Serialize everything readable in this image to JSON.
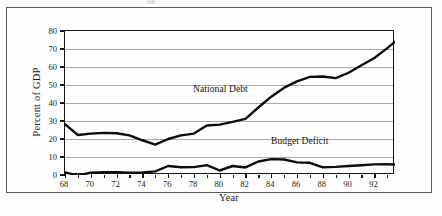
{
  "figure": {
    "frame_border_color": "#5b5b5b",
    "background_color": "#fefefe"
  },
  "axis_titles": {
    "x": "Year",
    "y": "Percent of GDP"
  },
  "annotations": {
    "national_debt": "National Debt",
    "budget_deficit": "Budget Deficit"
  },
  "chart_data": {
    "type": "line",
    "title": "",
    "subtitle": "",
    "xlabel": "Year",
    "ylabel": "Percent of GDP",
    "xlim": [
      68,
      93.6
    ],
    "ylim": [
      0,
      80
    ],
    "grid": true,
    "legend_position": "inline-annotation",
    "line_color": "#0d0d0d",
    "gridline_color": "#a9a9a9",
    "axis_color": "#161616",
    "y_ticks": [
      0,
      10,
      20,
      30,
      40,
      50,
      60,
      70,
      80
    ],
    "y_tick_labels": [
      "0",
      "10",
      "20",
      "30",
      "40",
      "50",
      "60",
      "70",
      "80"
    ],
    "x_major_ticks": [
      68,
      70,
      72,
      74,
      76,
      78,
      80,
      82,
      84,
      86,
      88,
      90,
      92
    ],
    "x_major_tick_labels": [
      "68",
      "70",
      "72",
      "74",
      "76",
      "78",
      "80",
      "82",
      "84",
      "86",
      "88",
      "90",
      "92"
    ],
    "x_minor_ticks": [
      69,
      71,
      73,
      75,
      77,
      79,
      81,
      83,
      85,
      87,
      89,
      91,
      93
    ],
    "x": [
      68,
      69,
      70,
      71,
      72,
      73,
      74,
      75,
      76,
      77,
      78,
      79,
      80,
      81,
      82,
      83,
      84,
      85,
      86,
      87,
      88,
      89,
      90,
      91,
      92,
      93,
      93.6
    ],
    "series": [
      {
        "name": "National Debt",
        "values": [
          28.2,
          22.2,
          23.0,
          23.4,
          23.2,
          22.0,
          19.3,
          16.9,
          20.0,
          22.0,
          23.0,
          27.5,
          28.0,
          29.5,
          31.2,
          37.5,
          43.5,
          48.5,
          52.0,
          54.5,
          54.7,
          53.8,
          56.8,
          61.0,
          65.0,
          70.5,
          74.0
        ]
      },
      {
        "name": "Budget Deficit",
        "values": [
          1.5,
          -0.3,
          1.3,
          1.5,
          1.5,
          1.3,
          1.4,
          2.0,
          5.0,
          4.3,
          4.4,
          5.5,
          2.5,
          5.0,
          4.2,
          7.5,
          8.8,
          8.6,
          7.0,
          6.8,
          4.3,
          4.5,
          5.0,
          5.4,
          5.9,
          6.0,
          5.8
        ]
      }
    ]
  }
}
